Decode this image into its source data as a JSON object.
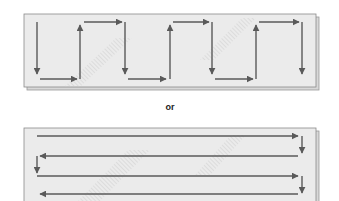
{
  "figure": {
    "separator_label": "or",
    "panels": [
      {
        "name": "vertical-serpentine-pattern",
        "description": "Vertical back-and-forth scan path with up/down strokes joined by horizontal steps",
        "direction": "vertical"
      },
      {
        "name": "horizontal-serpentine-pattern",
        "description": "Horizontal back-and-forth scan path with left/right strokes joined by downward steps",
        "direction": "horizontal"
      }
    ],
    "colors": {
      "panel_fill": "#ebebeb",
      "panel_border": "#8a8a8a",
      "arrow": "#5a5a5a",
      "hatch": "#c8c8c8"
    }
  }
}
